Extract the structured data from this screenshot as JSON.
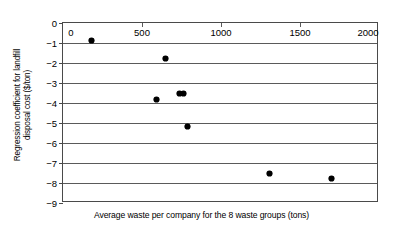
{
  "chart_data": {
    "type": "scatter",
    "title": "",
    "xlabel": "Average waste per company for the 8 waste groups (tons)",
    "ylabel": "Regression coefficient for landfill disposal cost ($/ton)",
    "ylabel_line1": "Regression coefficient for landfill",
    "ylabel_line2": "disposal cost ($/ton)",
    "xlim": [
      0,
      2000
    ],
    "ylim": [
      -9,
      0
    ],
    "xticks": [
      0,
      500,
      1000,
      1500,
      2000
    ],
    "xtick_labels": [
      "0",
      "500",
      "1000",
      "1500",
      "2000"
    ],
    "yticks": [
      0,
      -1,
      -2,
      -3,
      -4,
      -5,
      -6,
      -7,
      -8,
      -9
    ],
    "ytick_labels": [
      "0",
      "−1",
      "−2",
      "−3",
      "−4",
      "−5",
      "−6",
      "−7",
      "−8",
      "−9"
    ],
    "grid": "horizontal",
    "x_axis_position": "top",
    "legend": "none",
    "marker": "filled-circle",
    "marker_color": "#000000",
    "points": [
      {
        "x": 180,
        "y": -0.87
      },
      {
        "x": 650,
        "y": -1.75
      },
      {
        "x": 590,
        "y": -3.82
      },
      {
        "x": 735,
        "y": -3.52
      },
      {
        "x": 765,
        "y": -3.5
      },
      {
        "x": 790,
        "y": -5.15
      },
      {
        "x": 1310,
        "y": -7.53
      },
      {
        "x": 1700,
        "y": -7.78
      }
    ]
  }
}
